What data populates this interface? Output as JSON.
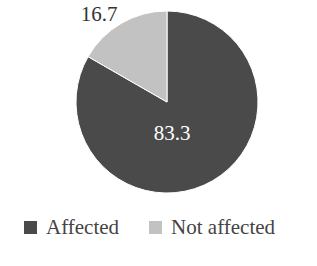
{
  "chart_data": {
    "type": "pie",
    "title": "",
    "categories": [
      "Affected",
      "Not affected"
    ],
    "values": [
      83.3,
      16.7
    ],
    "colors": [
      "#4a4a4a",
      "#c2c2c2"
    ],
    "data_labels": [
      "83.3",
      "16.7"
    ],
    "legend_position": "bottom",
    "start_angle_deg": 0,
    "direction": "clockwise"
  },
  "legend": {
    "items": [
      {
        "label": "Affected",
        "color": "#4a4a4a"
      },
      {
        "label": "Not affected",
        "color": "#c2c2c2"
      }
    ]
  }
}
